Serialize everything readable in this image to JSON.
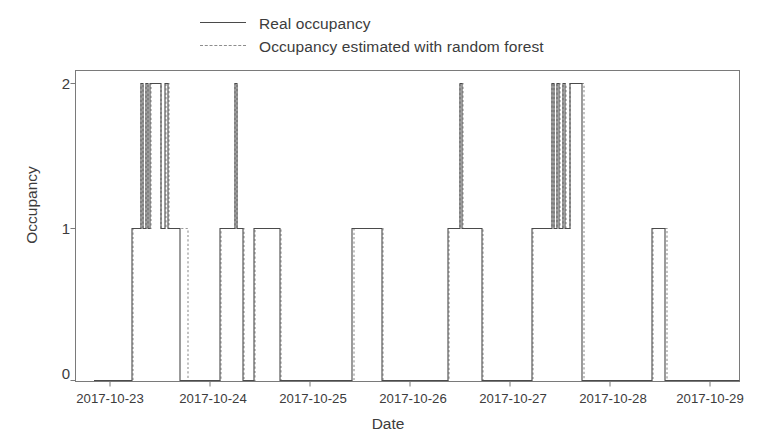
{
  "chart_data": {
    "type": "line",
    "title": "",
    "xlabel": "Date",
    "ylabel": "Occupancy",
    "ylim": [
      0,
      2
    ],
    "yticks": [
      0,
      1,
      2
    ],
    "ytick_labels": [
      "0",
      "1",
      "2"
    ],
    "xlim": [
      "2017-10-23",
      "2017-10-29"
    ],
    "xticks": [
      "2017-10-23",
      "2017-10-24",
      "2017-10-25",
      "2017-10-26",
      "2017-10-27",
      "2017-10-28",
      "2017-10-29"
    ],
    "grid": false,
    "legend_position": "top-center",
    "legend": [
      "Real occupancy",
      "Occupancy estimated with random forest"
    ],
    "series": [
      {
        "name": "Real occupancy",
        "style": "solid",
        "color": "#4a4a4a",
        "steps": [
          {
            "x": "2017-10-22.84",
            "y": 0
          },
          {
            "x": "2017-10-23.22",
            "y": 1
          },
          {
            "x": "2017-10-23.31",
            "y": 2
          },
          {
            "x": "2017-10-23.33",
            "y": 1
          },
          {
            "x": "2017-10-23.36",
            "y": 2
          },
          {
            "x": "2017-10-23.38",
            "y": 1
          },
          {
            "x": "2017-10-23.40",
            "y": 2
          },
          {
            "x": "2017-10-23.51",
            "y": 1
          },
          {
            "x": "2017-10-23.55",
            "y": 2
          },
          {
            "x": "2017-10-23.58",
            "y": 1
          },
          {
            "x": "2017-10-23.70",
            "y": 0
          },
          {
            "x": "2017-10-24.10",
            "y": 1
          },
          {
            "x": "2017-10-24.25",
            "y": 2
          },
          {
            "x": "2017-10-24.27",
            "y": 1
          },
          {
            "x": "2017-10-24.33",
            "y": 0
          },
          {
            "x": "2017-10-24.44",
            "y": 1
          },
          {
            "x": "2017-10-24.70",
            "y": 0
          },
          {
            "x": "2017-10-25.42",
            "y": 1
          },
          {
            "x": "2017-10-25.72",
            "y": 0
          },
          {
            "x": "2017-10-26.38",
            "y": 1
          },
          {
            "x": "2017-10-26.50",
            "y": 2
          },
          {
            "x": "2017-10-26.52",
            "y": 1
          },
          {
            "x": "2017-10-26.72",
            "y": 0
          },
          {
            "x": "2017-10-27.22",
            "y": 1
          },
          {
            "x": "2017-10-27.42",
            "y": 2
          },
          {
            "x": "2017-10-27.44",
            "y": 1
          },
          {
            "x": "2017-10-27.47",
            "y": 2
          },
          {
            "x": "2017-10-27.49",
            "y": 1
          },
          {
            "x": "2017-10-27.53",
            "y": 2
          },
          {
            "x": "2017-10-27.55",
            "y": 1
          },
          {
            "x": "2017-10-27.60",
            "y": 2
          },
          {
            "x": "2017-10-27.72",
            "y": 0
          },
          {
            "x": "2017-10-28.42",
            "y": 1
          },
          {
            "x": "2017-10-28.55",
            "y": 0
          },
          {
            "x": "2017-10-29.00",
            "y": 0
          }
        ]
      },
      {
        "name": "Occupancy estimated with random forest",
        "style": "dashed",
        "color": "#8d8d8d",
        "steps": [
          {
            "x": "2017-10-22.84",
            "y": 0
          },
          {
            "x": "2017-10-23.23",
            "y": 1
          },
          {
            "x": "2017-10-23.31",
            "y": 2
          },
          {
            "x": "2017-10-23.33",
            "y": 1
          },
          {
            "x": "2017-10-23.36",
            "y": 2
          },
          {
            "x": "2017-10-23.38",
            "y": 1
          },
          {
            "x": "2017-10-23.41",
            "y": 2
          },
          {
            "x": "2017-10-23.51",
            "y": 1
          },
          {
            "x": "2017-10-23.56",
            "y": 2
          },
          {
            "x": "2017-10-23.59",
            "y": 1
          },
          {
            "x": "2017-10-23.78",
            "y": 0
          },
          {
            "x": "2017-10-24.11",
            "y": 1
          },
          {
            "x": "2017-10-24.25",
            "y": 2
          },
          {
            "x": "2017-10-24.27",
            "y": 1
          },
          {
            "x": "2017-10-24.34",
            "y": 0
          },
          {
            "x": "2017-10-24.45",
            "y": 1
          },
          {
            "x": "2017-10-24.71",
            "y": 0
          },
          {
            "x": "2017-10-25.44",
            "y": 1
          },
          {
            "x": "2017-10-25.73",
            "y": 0
          },
          {
            "x": "2017-10-26.39",
            "y": 1
          },
          {
            "x": "2017-10-26.50",
            "y": 2
          },
          {
            "x": "2017-10-26.53",
            "y": 1
          },
          {
            "x": "2017-10-26.73",
            "y": 0
          },
          {
            "x": "2017-10-27.23",
            "y": 1
          },
          {
            "x": "2017-10-27.42",
            "y": 2
          },
          {
            "x": "2017-10-27.44",
            "y": 1
          },
          {
            "x": "2017-10-27.47",
            "y": 2
          },
          {
            "x": "2017-10-27.50",
            "y": 1
          },
          {
            "x": "2017-10-27.53",
            "y": 2
          },
          {
            "x": "2017-10-27.56",
            "y": 1
          },
          {
            "x": "2017-10-27.60",
            "y": 2
          },
          {
            "x": "2017-10-27.74",
            "y": 0
          },
          {
            "x": "2017-10-28.43",
            "y": 1
          },
          {
            "x": "2017-10-28.57",
            "y": 0
          },
          {
            "x": "2017-10-29.00",
            "y": 0
          }
        ]
      }
    ]
  },
  "axes": {
    "frame_color": "#7a7a7a",
    "ytick_labels": [
      "2",
      "1",
      "0"
    ],
    "xtick_labels": [
      "2017-10-23",
      "2017-10-24",
      "2017-10-25",
      "2017-10-26",
      "2017-10-27",
      "2017-10-28",
      "2017-10-29"
    ],
    "ylabel": "Occupancy",
    "xlabel": "Date"
  },
  "legend": {
    "entries": [
      {
        "label": "Real occupancy",
        "style": "solid"
      },
      {
        "label": "Occupancy estimated with random forest",
        "style": "dashed"
      }
    ]
  }
}
